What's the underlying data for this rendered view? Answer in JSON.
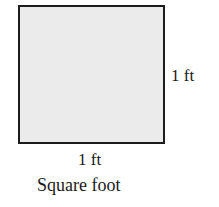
{
  "diagram": {
    "shape": "square",
    "fill_color": "#ebebeb",
    "border_color": "#1c1c1c",
    "side_label": "1 ft",
    "bottom_label": "1 ft",
    "caption": "Square foot"
  }
}
